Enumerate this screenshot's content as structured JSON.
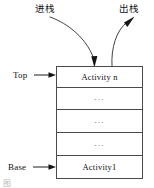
{
  "diagram": {
    "title_push": "进栈",
    "title_pop": "出栈",
    "side_labels": {
      "top": "Top",
      "base": "Base"
    },
    "stack": {
      "rows": [
        {
          "label": "Activity n",
          "kind": "activity"
        },
        {
          "label": "...",
          "kind": "ellipsis"
        },
        {
          "label": "...",
          "kind": "ellipsis"
        },
        {
          "label": "...",
          "kind": "ellipsis"
        },
        {
          "label": "Activity1",
          "kind": "activity"
        }
      ]
    },
    "arrows": {
      "push_arrow": "curved-arrow-down-into-stack",
      "pop_arrow": "curved-arrow-up-out-of-stack",
      "top_pointer": "arrow-right",
      "base_pointer": "arrow-right"
    },
    "caption_remnant": "图",
    "colors": {
      "stroke": "#4a4a4a",
      "text": "#111111",
      "ellipsis": "#5d5d5d",
      "background": "#ffffff"
    }
  }
}
